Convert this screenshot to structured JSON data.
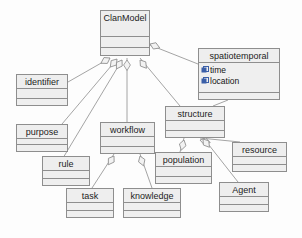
{
  "diagram": {
    "kind": "uml-class-diagram",
    "title": "ClanModel",
    "background_color": "#fdfdfd",
    "box_fill_color": "#efefef",
    "box_border_color": "#8e8e8e",
    "text_color": "#1c1c1c",
    "attribute_icon_color": "#3b5fa8"
  },
  "classes": [
    {
      "id": "clanmodel",
      "name": "ClanModel",
      "x": 100,
      "y": 10,
      "w": 50,
      "h": 46,
      "name_h": 26,
      "attributes": [],
      "operations": []
    },
    {
      "id": "spatiotemporal",
      "name": "spatiotemporal",
      "x": 198,
      "y": 48,
      "w": 82,
      "h": 52,
      "name_h": 14,
      "attributes": [
        "time",
        "location"
      ],
      "operations": []
    },
    {
      "id": "identifier",
      "name": "identifier",
      "x": 16,
      "y": 74,
      "w": 52,
      "h": 32,
      "name_h": 14,
      "attributes": [],
      "operations": []
    },
    {
      "id": "purpose",
      "name": "purpose",
      "x": 16,
      "y": 124,
      "w": 52,
      "h": 28,
      "name_h": 14,
      "attributes": [],
      "operations": []
    },
    {
      "id": "workflow",
      "name": "workflow",
      "x": 100,
      "y": 122,
      "w": 55,
      "h": 32,
      "name_h": 14,
      "attributes": [],
      "operations": []
    },
    {
      "id": "structure",
      "name": "structure",
      "x": 165,
      "y": 106,
      "w": 60,
      "h": 32,
      "name_h": 14,
      "attributes": [],
      "operations": []
    },
    {
      "id": "rule",
      "name": "rule",
      "x": 42,
      "y": 156,
      "w": 48,
      "h": 30,
      "name_h": 14,
      "attributes": [],
      "operations": []
    },
    {
      "id": "population",
      "name": "population",
      "x": 155,
      "y": 152,
      "w": 57,
      "h": 32,
      "name_h": 14,
      "attributes": [],
      "operations": []
    },
    {
      "id": "resource",
      "name": "resource",
      "x": 232,
      "y": 142,
      "w": 55,
      "h": 30,
      "name_h": 14,
      "attributes": [],
      "operations": []
    },
    {
      "id": "task",
      "name": "task",
      "x": 66,
      "y": 188,
      "w": 48,
      "h": 30,
      "name_h": 14,
      "attributes": [],
      "operations": []
    },
    {
      "id": "knowledge",
      "name": "knowledge",
      "x": 123,
      "y": 188,
      "w": 58,
      "h": 30,
      "name_h": 14,
      "attributes": [],
      "operations": []
    },
    {
      "id": "agent",
      "name": "Agent",
      "x": 219,
      "y": 182,
      "w": 50,
      "h": 30,
      "name_h": 14,
      "attributes": [],
      "operations": []
    }
  ],
  "relationships": [
    {
      "from": "clanmodel",
      "to": "identifier",
      "type": "aggregation"
    },
    {
      "from": "clanmodel",
      "to": "purpose",
      "type": "aggregation"
    },
    {
      "from": "clanmodel",
      "to": "rule",
      "type": "aggregation"
    },
    {
      "from": "clanmodel",
      "to": "workflow",
      "type": "aggregation"
    },
    {
      "from": "clanmodel",
      "to": "structure",
      "type": "aggregation"
    },
    {
      "from": "clanmodel",
      "to": "spatiotemporal",
      "type": "aggregation"
    },
    {
      "from": "workflow",
      "to": "task",
      "type": "aggregation"
    },
    {
      "from": "workflow",
      "to": "knowledge",
      "type": "aggregation"
    },
    {
      "from": "structure",
      "to": "population",
      "type": "aggregation"
    },
    {
      "from": "structure",
      "to": "resource",
      "type": "aggregation"
    },
    {
      "from": "structure",
      "to": "agent",
      "type": "aggregation"
    }
  ],
  "edge_paths": [
    {
      "id": "e-identifier",
      "d": "M 110 58 L 68 82",
      "diamond_at": [
        110,
        58
      ],
      "diamond_angle": 150
    },
    {
      "id": "e-purpose",
      "d": "M 117 59 L 62 124",
      "diamond_at": [
        117,
        59
      ],
      "diamond_angle": 130
    },
    {
      "id": "e-rule",
      "d": "M 122 60 L 63 158",
      "diamond_at": [
        122,
        60
      ],
      "diamond_angle": 122
    },
    {
      "id": "e-workflow",
      "d": "M 127 58 L 127 122",
      "diamond_at": [
        127,
        60
      ],
      "diamond_angle": 90
    },
    {
      "id": "e-structure",
      "d": "M 140 58 L 180 106",
      "diamond_at": [
        140,
        60
      ],
      "diamond_angle": 52
    },
    {
      "id": "e-spatiotemporal",
      "d": "M 150 45 L 198 64",
      "diamond_at": [
        150,
        44
      ],
      "diamond_angle": 22
    },
    {
      "id": "e-task",
      "d": "M 114 154 L 92 188",
      "diamond_at": [
        114,
        156
      ],
      "diamond_angle": 123
    },
    {
      "id": "e-knowledge",
      "d": "M 140 154 L 152 188",
      "diamond_at": [
        140,
        156
      ],
      "diamond_angle": 70
    },
    {
      "id": "e-population",
      "d": "M 184 138 L 180 152",
      "diamond_at": [
        184,
        140
      ],
      "diamond_angle": 105
    },
    {
      "id": "e-resource",
      "d": "M 200 138 L 240 142",
      "diamond_at": [
        200,
        140
      ],
      "diamond_angle": 14
    },
    {
      "id": "e-agent",
      "d": "M 205 140 L 238 182",
      "diamond_at": [
        203,
        139
      ],
      "diamond_angle": 52
    },
    {
      "id": "e-struct-spatio",
      "d": "M 213 106 L 228 100",
      "diamond_at": null,
      "diamond_angle": 0
    }
  ]
}
